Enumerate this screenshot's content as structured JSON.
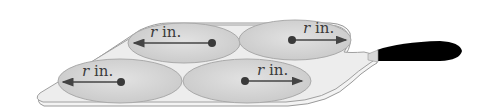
{
  "diagram": {
    "type": "illustration",
    "colors": {
      "background": "#ffffff",
      "pan_fill": "#efefef",
      "pan_stroke": "#9a9a9a",
      "pancake_fill": "#d6d6d6",
      "pancake_stroke": "#a8a8a8",
      "arrow": "#444444",
      "center_dot": "#3a3a3a",
      "handle": "#000000"
    },
    "pancakes": [
      {
        "position": "top-left",
        "label_var": "r",
        "label_unit": " in.",
        "arrow_direction": "left"
      },
      {
        "position": "top-right",
        "label_var": "r",
        "label_unit": " in.",
        "arrow_direction": "right"
      },
      {
        "position": "bottom-left",
        "label_var": "r",
        "label_unit": " in.",
        "arrow_direction": "left"
      },
      {
        "position": "bottom-right",
        "label_var": "r",
        "label_unit": " in.",
        "arrow_direction": "right"
      }
    ]
  }
}
